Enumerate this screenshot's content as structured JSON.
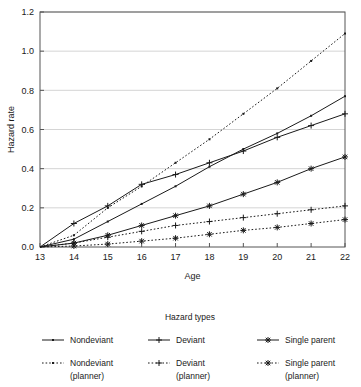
{
  "chart_data": {
    "type": "line",
    "title": "",
    "xlabel": "Age",
    "ylabel": "Hazard rate",
    "xlim": [
      13,
      22
    ],
    "ylim": [
      0.0,
      1.2
    ],
    "xticks": [
      13,
      14,
      15,
      16,
      17,
      18,
      19,
      20,
      21,
      22
    ],
    "yticks": [
      "0.0",
      "0.2",
      "0.4",
      "0.6",
      "0.8",
      "1.0",
      "1.2"
    ],
    "grid": "horizontal",
    "legend_title": "Hazard types",
    "legend_position": "below",
    "x": [
      13,
      14,
      15,
      16,
      17,
      18,
      19,
      20,
      21,
      22
    ],
    "series": [
      {
        "name": "Nondeviant",
        "linestyle": "solid",
        "marker": "dot",
        "color": "#1a1a1a",
        "values": [
          0.0,
          0.04,
          0.13,
          0.22,
          0.31,
          0.41,
          0.5,
          0.58,
          0.67,
          0.77
        ]
      },
      {
        "name": "Deviant",
        "linestyle": "solid",
        "marker": "plus",
        "color": "#1a1a1a",
        "values": [
          0.0,
          0.12,
          0.21,
          0.32,
          0.37,
          0.43,
          0.49,
          0.56,
          0.62,
          0.68
        ]
      },
      {
        "name": "Single parent",
        "linestyle": "solid",
        "marker": "asterisk",
        "color": "#1a1a1a",
        "values": [
          0.0,
          0.02,
          0.06,
          0.11,
          0.16,
          0.21,
          0.27,
          0.33,
          0.4,
          0.46
        ]
      },
      {
        "name": "Nondeviant (planner)",
        "linestyle": "dotted",
        "marker": "dot",
        "color": "#1a1a1a",
        "values": [
          0.0,
          0.06,
          0.2,
          0.31,
          0.43,
          0.55,
          0.68,
          0.81,
          0.95,
          1.09
        ]
      },
      {
        "name": "Deviant (planner)",
        "linestyle": "dotted",
        "marker": "plus",
        "color": "#1a1a1a",
        "values": [
          0.0,
          0.02,
          0.05,
          0.08,
          0.11,
          0.13,
          0.15,
          0.17,
          0.19,
          0.21
        ]
      },
      {
        "name": "Single parent (planner)",
        "linestyle": "dotted",
        "marker": "asterisk",
        "color": "#1a1a1a",
        "values": [
          0.0,
          0.005,
          0.015,
          0.03,
          0.045,
          0.065,
          0.085,
          0.1,
          0.12,
          0.14
        ]
      }
    ]
  },
  "legend": {
    "title": "Hazard types",
    "entries": [
      {
        "label_line1": "Nondeviant",
        "label_line2": "",
        "marker": "dot",
        "linestyle": "solid"
      },
      {
        "label_line1": "Deviant",
        "label_line2": "",
        "marker": "plus",
        "linestyle": "solid"
      },
      {
        "label_line1": "Single parent",
        "label_line2": "",
        "marker": "asterisk",
        "linestyle": "solid"
      },
      {
        "label_line1": "Nondeviant",
        "label_line2": "(planner)",
        "marker": "dot",
        "linestyle": "dotted"
      },
      {
        "label_line1": "Deviant",
        "label_line2": "(planner)",
        "marker": "plus",
        "linestyle": "dotted"
      },
      {
        "label_line1": "Single parent",
        "label_line2": "(planner)",
        "marker": "asterisk",
        "linestyle": "dotted"
      }
    ]
  },
  "axes": {
    "y_title": "Hazard rate",
    "x_title": "Age"
  },
  "colors": {
    "line": "#1a1a1a",
    "grid": "#b8b8b8",
    "frame": "#555555",
    "background": "#ffffff"
  }
}
